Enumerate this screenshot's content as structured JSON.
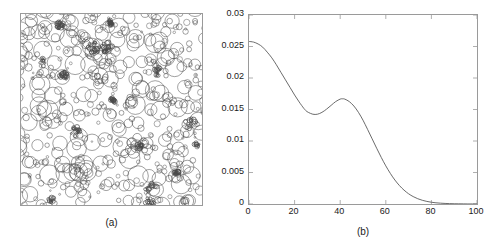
{
  "figure": {
    "panels": [
      {
        "id": "a",
        "caption": "(a)",
        "type": "circle-realization",
        "description": "Boolean germ-grain model realization: unfilled circles of varying radii scattered in a square window",
        "border_color": "#9a9a9a",
        "circle_color": "#4a4a4a",
        "window": {
          "x_min": 0,
          "x_max": 1,
          "y_min": 0,
          "y_max": 1
        }
      },
      {
        "id": "b",
        "caption": "(b)",
        "type": "line-plot",
        "border_color": "#9a9a9a",
        "curve_color": "#5a5a5a"
      }
    ]
  },
  "chart_data": {
    "type": "line",
    "title": "",
    "subtitle": "",
    "xlabel": "",
    "ylabel": "",
    "xlim": [
      0,
      100
    ],
    "ylim": [
      0,
      0.03
    ],
    "xticks": [
      0,
      20,
      40,
      60,
      80,
      100
    ],
    "yticks": [
      0,
      0.005,
      0.01,
      0.015,
      0.02,
      0.025,
      0.03
    ],
    "xtick_labels": [
      "0",
      "20",
      "40",
      "60",
      "80",
      "100"
    ],
    "ytick_labels": [
      "0",
      "0.005",
      "0.01",
      "0.015",
      "0.02",
      "0.025",
      "0.03"
    ],
    "grid": false,
    "legend": null,
    "annotations": [],
    "series": [
      {
        "name": "covariance",
        "x": [
          0,
          2,
          4,
          6,
          8,
          10,
          12,
          14,
          16,
          18,
          20,
          22,
          24,
          25,
          26,
          28,
          30,
          32,
          34,
          36,
          38,
          40,
          41,
          42,
          44,
          46,
          48,
          50,
          52,
          54,
          56,
          58,
          60,
          62,
          64,
          66,
          68,
          70,
          72,
          74,
          76,
          78,
          80,
          82,
          84,
          86,
          88,
          90,
          92,
          94,
          96,
          98,
          100
        ],
        "y": [
          0.0258,
          0.0257,
          0.0254,
          0.0249,
          0.0241,
          0.0232,
          0.0221,
          0.0209,
          0.0197,
          0.0185,
          0.0173,
          0.0162,
          0.0152,
          0.0148,
          0.01455,
          0.01425,
          0.01425,
          0.01455,
          0.01505,
          0.01565,
          0.01625,
          0.01665,
          0.0167,
          0.01665,
          0.01625,
          0.01555,
          0.01455,
          0.0133,
          0.01185,
          0.01035,
          0.00885,
          0.0074,
          0.00605,
          0.00485,
          0.0038,
          0.00292,
          0.0022,
          0.00162,
          0.00118,
          0.00084,
          0.00059,
          0.00041,
          0.00028,
          0.00019,
          0.00013,
          9e-05,
          6e-05,
          4e-05,
          3e-05,
          2e-05,
          1e-05,
          1e-05,
          0.0
        ]
      }
    ],
    "local_minimum": {
      "x": 29,
      "y": 0.01425
    },
    "local_maximum": {
      "x": 41,
      "y": 0.0167
    },
    "start_value": {
      "x": 0,
      "y": 0.0258
    }
  }
}
